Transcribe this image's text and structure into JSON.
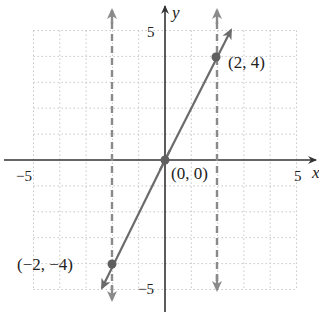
{
  "chart_data": {
    "type": "line",
    "title": "",
    "xlabel": "x",
    "ylabel": "y",
    "xlim": [
      -5,
      5
    ],
    "ylim": [
      -5,
      5
    ],
    "grid": true,
    "x_ticks_labeled": [
      {
        "value": -5,
        "label": "−5"
      },
      {
        "value": 5,
        "label": "5"
      }
    ],
    "y_ticks_labeled": [
      {
        "value": 5,
        "label": "5"
      },
      {
        "value": -5,
        "label": "−5"
      }
    ],
    "series": [
      {
        "name": "y = 2x",
        "kind": "solid-line",
        "x": [
          -2.4,
          2.5
        ],
        "y": [
          -4.8,
          5.0
        ],
        "color": "#6b6b6b"
      },
      {
        "name": "x = -2",
        "kind": "dashed-vertical",
        "x": -2,
        "color": "#8a8a8a"
      },
      {
        "name": "x = 2",
        "kind": "dashed-vertical",
        "x": 2,
        "color": "#8a8a8a"
      }
    ],
    "points": [
      {
        "x": -2,
        "y": -4,
        "label": "(−2, −4)"
      },
      {
        "x": 0,
        "y": 0,
        "label": "(0, 0)"
      },
      {
        "x": 2,
        "y": 4,
        "label": "(2, 4)"
      }
    ]
  },
  "labels": {
    "x_axis": "x",
    "y_axis": "y",
    "x_min": "−5",
    "x_max": "5",
    "y_max": "5",
    "y_min": "−5",
    "p1": "(2, 4)",
    "p2": "(0, 0)",
    "p3": "(−2, −4)"
  }
}
